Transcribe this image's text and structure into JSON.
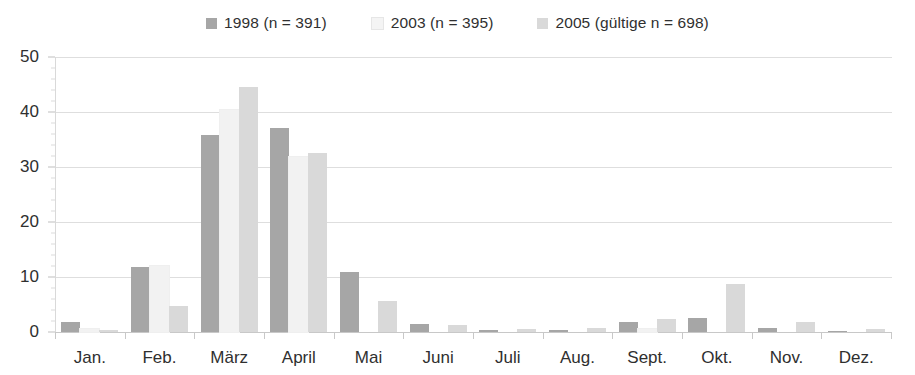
{
  "chart_data": {
    "type": "bar",
    "title": "",
    "subtitle": "",
    "xlabel": "",
    "ylabel": "",
    "ylim": [
      0,
      50
    ],
    "yticks": [
      0,
      10,
      20,
      30,
      40,
      50
    ],
    "ytick_labels": [
      "0",
      "10",
      "20",
      "30",
      "40",
      "50"
    ],
    "grid": true,
    "legend_position": "top-center",
    "categories": [
      "Jan.",
      "Feb.",
      "März",
      "April",
      "Mai",
      "Juni",
      "Juli",
      "Aug.",
      "Sept.",
      "Okt.",
      "Nov.",
      "Dez."
    ],
    "series": [
      {
        "name": "1998 (n = 391)",
        "color": "#a6a6a6",
        "values": [
          1.8,
          11.9,
          35.8,
          37.1,
          11.0,
          1.4,
          0.3,
          0.3,
          1.8,
          2.6,
          0.8,
          0.2
        ]
      },
      {
        "name": "2003 (n = 395)",
        "color": "#f2f2f2",
        "values": [
          0.5,
          12.0,
          40.4,
          31.9,
          0.0,
          0.0,
          0.0,
          0.0,
          0.5,
          0.0,
          0.0,
          0.0
        ]
      },
      {
        "name": "2005 (gültige n = 698)",
        "color": "#d9d9d9",
        "values": [
          0.3,
          4.7,
          44.6,
          32.5,
          5.6,
          1.2,
          0.6,
          0.7,
          2.4,
          8.7,
          1.9,
          0.6
        ]
      }
    ]
  },
  "legend": {
    "entries": [
      {
        "label": "1998 (n = 391)",
        "swatch_color": "#a6a6a6"
      },
      {
        "label": "2003 (n = 395)",
        "swatch_color": "#f4f4f4"
      },
      {
        "label": "2005 (gültige n = 698)",
        "swatch_color": "#d9d9d9"
      }
    ]
  },
  "axes": {
    "y": {
      "ticks": [
        "0",
        "10",
        "20",
        "30",
        "40",
        "50"
      ]
    },
    "x": {
      "ticks": [
        "Jan.",
        "Feb.",
        "März",
        "April",
        "Mai",
        "Juni",
        "Juli",
        "Aug.",
        "Sept.",
        "Okt.",
        "Nov.",
        "Dez."
      ]
    }
  },
  "colors": {
    "gridline": "#dedede",
    "axis": "#c8c8c8",
    "text": "#2f2f2f",
    "background": "#ffffff"
  }
}
